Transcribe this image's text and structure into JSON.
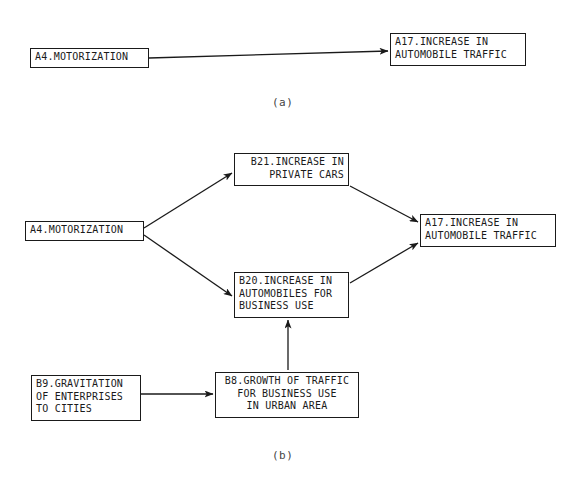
{
  "figure": {
    "background_color": "#ffffff",
    "line_color": "#1a1a1a",
    "panels": [
      {
        "id": "panel-a",
        "caption": "(a)",
        "caption_x": 272,
        "caption_y": 96,
        "nodes": [
          {
            "id": "a-A4",
            "name": "node-a4-motorization",
            "lines": [
              "A4.MOTORIZATION"
            ],
            "align": "left",
            "x": 30,
            "y": 48,
            "w": 119,
            "h": 20
          },
          {
            "id": "a-A17",
            "name": "node-a17-increase-in-automobile-traffic",
            "lines": [
              "A17.INCREASE IN",
              "AUTOMOBILE TRAFFIC"
            ],
            "align": "left",
            "x": 390,
            "y": 33,
            "w": 136,
            "h": 33
          }
        ],
        "edges": [
          {
            "id": "a-edge-1",
            "name": "edge-a4-to-a17",
            "from": "a-A4",
            "to": "a-A17",
            "x1": 149,
            "y1": 58,
            "x2": 388,
            "y2": 51,
            "arrow": true
          }
        ]
      },
      {
        "id": "panel-b",
        "caption": "(b)",
        "caption_x": 272,
        "caption_y": 449,
        "nodes": [
          {
            "id": "b-A4",
            "name": "node-a4-motorization",
            "lines": [
              "A4.MOTORIZATION"
            ],
            "align": "left",
            "x": 25,
            "y": 221,
            "w": 119,
            "h": 20
          },
          {
            "id": "b-B21",
            "name": "node-b21-increase-in-private-cars",
            "lines": [
              "B21.INCREASE IN",
              "PRIVATE CARS"
            ],
            "align": "right",
            "x": 234,
            "y": 153,
            "w": 115,
            "h": 33
          },
          {
            "id": "b-B20",
            "name": "node-b20-increase-in-automobiles-for-business-use",
            "lines": [
              "B20.INCREASE IN",
              "AUTOMOBILES FOR",
              "BUSINESS USE"
            ],
            "align": "left",
            "x": 234,
            "y": 272,
            "w": 115,
            "h": 46
          },
          {
            "id": "b-A17",
            "name": "node-a17-increase-in-automobile-traffic",
            "lines": [
              "A17.INCREASE IN",
              "AUTOMOBILE TRAFFIC"
            ],
            "align": "left",
            "x": 420,
            "y": 214,
            "w": 136,
            "h": 33
          },
          {
            "id": "b-B9",
            "name": "node-b9-gravitation-of-enterprises-to-cities",
            "lines": [
              "B9.GRAVITATION",
              "OF ENTERPRISES",
              "TO CITIES"
            ],
            "align": "left",
            "x": 31,
            "y": 375,
            "w": 110,
            "h": 46
          },
          {
            "id": "b-B8",
            "name": "node-b8-growth-of-traffic-for-business-use-in-urban-area",
            "lines": [
              "B8.GROWTH OF TRAFFIC",
              "FOR BUSINESS USE",
              "IN URBAN AREA"
            ],
            "align": "center",
            "x": 215,
            "y": 372,
            "w": 144,
            "h": 46
          }
        ],
        "edges": [
          {
            "id": "b-edge-1",
            "name": "edge-a4-to-b21",
            "from": "b-A4",
            "to": "b-B21",
            "x1": 144,
            "y1": 228,
            "x2": 232,
            "y2": 173,
            "arrow": true
          },
          {
            "id": "b-edge-2",
            "name": "edge-a4-to-b20",
            "from": "b-A4",
            "to": "b-B20",
            "x1": 144,
            "y1": 235,
            "x2": 232,
            "y2": 296,
            "arrow": true
          },
          {
            "id": "b-edge-3",
            "name": "edge-b21-to-a17",
            "from": "b-B21",
            "to": "b-A17",
            "x1": 350,
            "y1": 186,
            "x2": 418,
            "y2": 222,
            "arrow": true
          },
          {
            "id": "b-edge-4",
            "name": "edge-b20-to-a17",
            "from": "b-B20",
            "to": "b-A17",
            "x1": 350,
            "y1": 283,
            "x2": 418,
            "y2": 243,
            "arrow": true
          },
          {
            "id": "b-edge-5",
            "name": "edge-b8-to-b20",
            "from": "b-B8",
            "to": "b-B20",
            "x1": 288,
            "y1": 370,
            "x2": 288,
            "y2": 320,
            "arrow": true
          },
          {
            "id": "b-edge-6",
            "name": "edge-b9-to-b8",
            "from": "b-B9",
            "to": "b-B8",
            "x1": 141,
            "y1": 394,
            "x2": 213,
            "y2": 394,
            "arrow": true
          }
        ]
      }
    ]
  }
}
